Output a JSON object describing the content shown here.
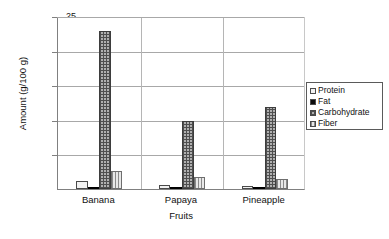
{
  "chart_data": {
    "type": "bar",
    "title": "",
    "xlabel": "Fruits",
    "ylabel": "Amount (g/100 g)",
    "categories": [
      "Banana",
      "Papaya",
      "Pineapple"
    ],
    "series": [
      {
        "name": "Protein",
        "values": [
          1.2,
          0.6,
          0.5
        ],
        "swatch": "white-empty"
      },
      {
        "name": "Fat",
        "values": [
          0.3,
          0.1,
          0.1
        ],
        "swatch": "solid-black"
      },
      {
        "name": "Carbohydrate",
        "values": [
          22.8,
          9.8,
          11.8
        ],
        "swatch": "dark-crosshatch"
      },
      {
        "name": "Fiber",
        "values": [
          2.6,
          1.8,
          1.5
        ],
        "swatch": "vertical-stripes"
      }
    ],
    "ylim": [
      0,
      25
    ],
    "yticks": [
      0,
      5,
      10,
      15,
      20,
      25
    ],
    "ytick_labels": [
      "",
      "5",
      "10",
      "15",
      "20",
      "25"
    ],
    "grid": "horizontal",
    "legend_position": "right"
  },
  "legend": {
    "items": [
      {
        "label": "Protein"
      },
      {
        "label": "Fat"
      },
      {
        "label": "Carbohydrate"
      },
      {
        "label": "Fiber"
      }
    ]
  },
  "axes": {
    "y_title": "Amount (g/100 g)",
    "x_title": "Fruits"
  }
}
